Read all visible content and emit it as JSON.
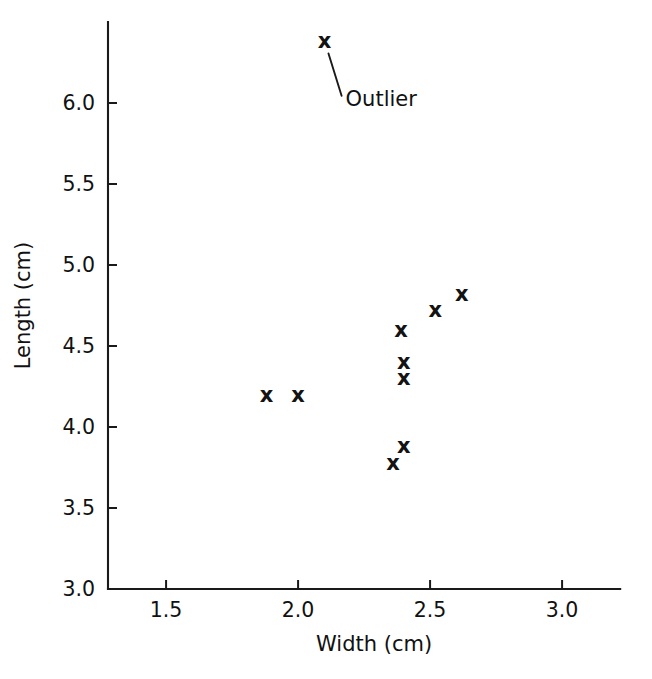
{
  "chart_data": {
    "type": "scatter",
    "title": "",
    "xlabel": "Width (cm)",
    "ylabel": "Length (cm)",
    "xlim": [
      1.28,
      3.22
    ],
    "ylim": [
      3.0,
      6.5
    ],
    "xticks": [
      "1.5",
      "2.0",
      "2.5",
      "3.0"
    ],
    "xtick_values": [
      1.5,
      2.0,
      2.5,
      3.0
    ],
    "yticks": [
      "3.0",
      "3.5",
      "4.0",
      "4.5",
      "5.0",
      "5.5",
      "6.0"
    ],
    "ytick_values": [
      3.0,
      3.5,
      4.0,
      4.5,
      5.0,
      5.5,
      6.0
    ],
    "grid": false,
    "legend": "none",
    "marker": "x",
    "series": [
      {
        "name": "measurements",
        "points": [
          {
            "x": 2.1,
            "y": 6.38,
            "label": "Outlier"
          },
          {
            "x": 2.62,
            "y": 4.82
          },
          {
            "x": 2.52,
            "y": 4.72
          },
          {
            "x": 2.39,
            "y": 4.6
          },
          {
            "x": 2.4,
            "y": 4.4
          },
          {
            "x": 2.4,
            "y": 4.3
          },
          {
            "x": 1.88,
            "y": 4.2
          },
          {
            "x": 2.0,
            "y": 4.2
          },
          {
            "x": 2.4,
            "y": 3.88
          },
          {
            "x": 2.36,
            "y": 3.78
          }
        ]
      }
    ],
    "annotations": [
      {
        "text": "Outlier",
        "point_x": 2.1,
        "point_y": 6.38,
        "text_x": 2.18,
        "text_y": 6.02
      }
    ]
  },
  "axis": {
    "x_title": "Width (cm)",
    "y_title": "Length (cm)"
  },
  "colors": {
    "ink": "#111111",
    "background": "#ffffff"
  }
}
